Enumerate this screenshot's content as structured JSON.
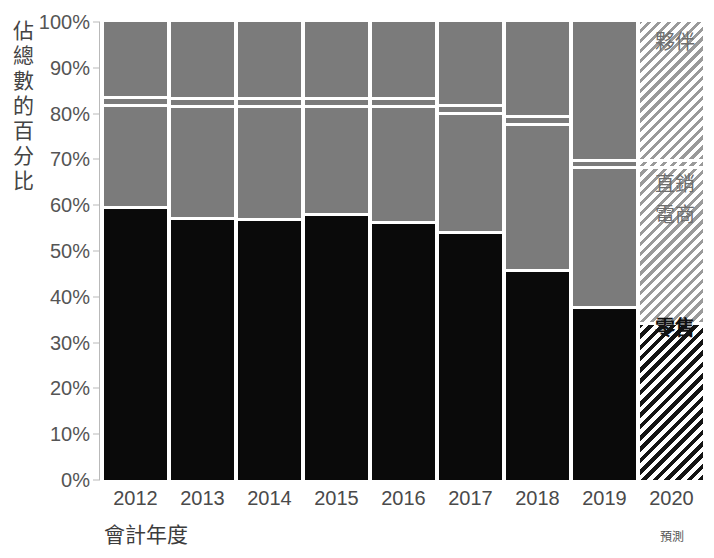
{
  "chart_data": {
    "type": "bar",
    "subtype": "stacked-100-percent",
    "title": "",
    "xlabel": "會計年度",
    "ylabel": "佔總數的百分比",
    "ylim": [
      0,
      100
    ],
    "ytick_labels": [
      "100%",
      "90%",
      "80%",
      "70%",
      "60%",
      "50%",
      "40%",
      "30%",
      "20%",
      "10%",
      "0%"
    ],
    "ytick_values": [
      100,
      90,
      80,
      70,
      60,
      50,
      40,
      30,
      20,
      10,
      0
    ],
    "categories": [
      "2012",
      "2013",
      "2014",
      "2015",
      "2016",
      "2017",
      "2018",
      "2019",
      "2020"
    ],
    "grid": false,
    "legend_position": "right",
    "forecast_category": "2020",
    "forecast_note": "預測",
    "series": [
      {
        "name": "零售",
        "key": "retail",
        "color": "#0a0a0a",
        "values": [
          59.8,
          57.4,
          57.2,
          58.2,
          56.5,
          54.3,
          46.0,
          38.0,
          34.5
        ]
      },
      {
        "name": "電商",
        "key": "ecommerce",
        "color": "#7b7b7b",
        "values": [
          22.2,
          24.4,
          24.7,
          23.6,
          25.3,
          26.0,
          32.0,
          30.5,
          34.0
        ]
      },
      {
        "name": "直銷",
        "key": "direct",
        "color": "#7b7b7b",
        "values": [
          1.8,
          1.8,
          1.8,
          1.9,
          1.9,
          1.9,
          1.8,
          1.6,
          1.6
        ]
      },
      {
        "name": "夥伴",
        "key": "partner",
        "color": "#7b7b7b",
        "values": [
          16.2,
          16.4,
          16.3,
          16.3,
          16.3,
          17.8,
          20.2,
          29.9,
          29.9
        ]
      }
    ]
  },
  "yaxis": {
    "title": "佔總數的百分比"
  },
  "xaxis": {
    "title": "會計年度",
    "forecast_note": "預測"
  },
  "legend": {
    "items": [
      {
        "label": "夥伴",
        "top": 26,
        "bold": false
      },
      {
        "label": "直銷",
        "top": 168,
        "bold": false
      },
      {
        "label": "電商",
        "top": 199,
        "bold": false
      },
      {
        "label": "零售",
        "top": 312,
        "bold": true
      }
    ]
  }
}
